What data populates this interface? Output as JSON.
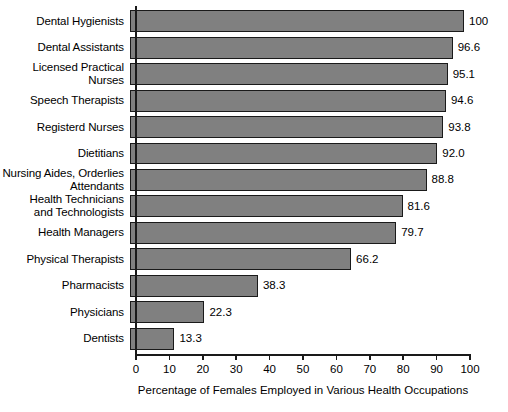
{
  "chart_data": {
    "type": "bar",
    "orientation": "horizontal",
    "title": "",
    "xlabel": "Percentage of Females Employed in Various Health Occupations",
    "ylabel": "",
    "xlim": [
      0,
      100
    ],
    "xticks": [
      0,
      10,
      20,
      30,
      40,
      50,
      60,
      70,
      80,
      90,
      100
    ],
    "xtick_labels": [
      "0",
      "10",
      "20",
      "30",
      "40",
      "50",
      "60",
      "70",
      "80",
      "90",
      "100"
    ],
    "grid": false,
    "legend": null,
    "bar_color": "#808080",
    "bar_edge_color": "#1a1a1a",
    "value_label_precision": "1 decimal (100 shown as integer)",
    "categories": [
      "Dental Hygienists",
      "Dental Assistants",
      "Licensed Practical\nNurses",
      "Speech Therapists",
      "Registerd Nurses",
      "Dietitians",
      "Nursing Aides, Orderlies\nAttendants",
      "Health Technicians\nand Technologists",
      "Health Managers",
      "Physical Therapists",
      "Pharmacists",
      "Physicians",
      "Dentists"
    ],
    "values": [
      100,
      96.6,
      95.1,
      94.6,
      93.8,
      92.0,
      88.8,
      81.6,
      79.7,
      66.2,
      38.3,
      22.3,
      13.3
    ],
    "value_labels": [
      "100",
      "96.6",
      "95.1",
      "94.6",
      "93.8",
      "92.0",
      "88.8",
      "81.6",
      "79.7",
      "66.2",
      "38.3",
      "22.3",
      "13.3"
    ]
  }
}
